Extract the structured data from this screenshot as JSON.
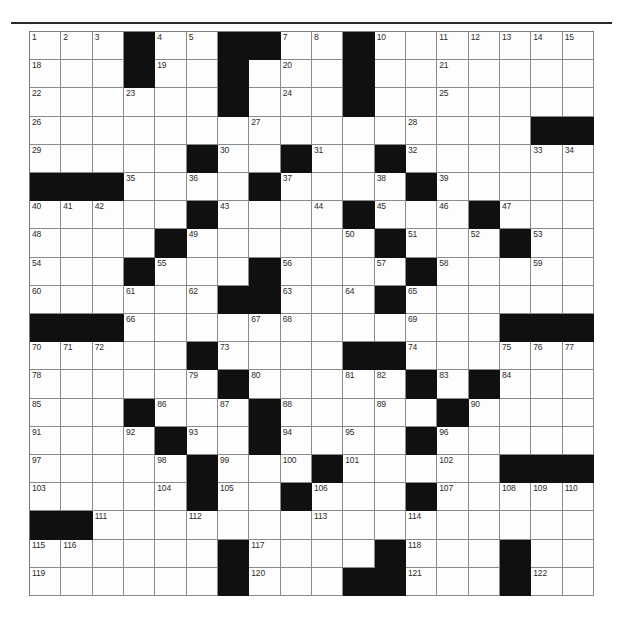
{
  "document": {
    "type": "crossword-puzzle-grid",
    "title": "",
    "has_top_rule": true
  },
  "grid": {
    "columns": 18,
    "rows": 20,
    "cell_background": "#fdfdfd",
    "block_color": "#101010",
    "line_color": "#8a8a8a",
    "number_color": "#2c2c2c",
    "blocks": [
      [
        0,
        3
      ],
      [
        0,
        6
      ],
      [
        0,
        7
      ],
      [
        0,
        10
      ],
      [
        1,
        3
      ],
      [
        1,
        6
      ],
      [
        1,
        10
      ],
      [
        2,
        6
      ],
      [
        2,
        10
      ],
      [
        3,
        16
      ],
      [
        3,
        17
      ],
      [
        4,
        5
      ],
      [
        4,
        8
      ],
      [
        4,
        11
      ],
      [
        5,
        0
      ],
      [
        5,
        1
      ],
      [
        5,
        2
      ],
      [
        5,
        7
      ],
      [
        5,
        12
      ],
      [
        6,
        5
      ],
      [
        6,
        10
      ],
      [
        6,
        14
      ],
      [
        7,
        4
      ],
      [
        7,
        11
      ],
      [
        7,
        15
      ],
      [
        8,
        3
      ],
      [
        8,
        7
      ],
      [
        8,
        12
      ],
      [
        9,
        6
      ],
      [
        9,
        7
      ],
      [
        9,
        11
      ],
      [
        10,
        0
      ],
      [
        10,
        1
      ],
      [
        10,
        2
      ],
      [
        10,
        15
      ],
      [
        10,
        16
      ],
      [
        10,
        17
      ],
      [
        11,
        5
      ],
      [
        11,
        10
      ],
      [
        11,
        11
      ],
      [
        12,
        6
      ],
      [
        12,
        12
      ],
      [
        12,
        14
      ],
      [
        13,
        3
      ],
      [
        13,
        7
      ],
      [
        13,
        13
      ],
      [
        14,
        4
      ],
      [
        14,
        7
      ],
      [
        14,
        12
      ],
      [
        15,
        5
      ],
      [
        15,
        9
      ],
      [
        15,
        15
      ],
      [
        15,
        16
      ],
      [
        15,
        17
      ],
      [
        16,
        5
      ],
      [
        16,
        8
      ],
      [
        16,
        12
      ],
      [
        17,
        0
      ],
      [
        17,
        1
      ],
      [
        18,
        6
      ],
      [
        18,
        11
      ],
      [
        19,
        6
      ],
      [
        19,
        11
      ],
      [
        20,
        6
      ],
      [
        20,
        11
      ],
      [
        18,
        15
      ],
      [
        19,
        15
      ],
      [
        19,
        10
      ],
      [
        20,
        10
      ],
      [
        20,
        15
      ]
    ],
    "numbers": [
      {
        "row": 0,
        "col": 0,
        "n": "1"
      },
      {
        "row": 0,
        "col": 1,
        "n": "2"
      },
      {
        "row": 0,
        "col": 2,
        "n": "3"
      },
      {
        "row": 0,
        "col": 4,
        "n": "4"
      },
      {
        "row": 0,
        "col": 5,
        "n": "5"
      },
      {
        "row": 0,
        "col": 6,
        "n": "6"
      },
      {
        "row": 0,
        "col": 8,
        "n": "7"
      },
      {
        "row": 0,
        "col": 9,
        "n": "8"
      },
      {
        "row": 0,
        "col": 10,
        "n": "9"
      },
      {
        "row": 0,
        "col": 11,
        "n": "10"
      },
      {
        "row": 0,
        "col": 13,
        "n": "11"
      },
      {
        "row": 0,
        "col": 14,
        "n": "12"
      },
      {
        "row": 0,
        "col": 15,
        "n": "13"
      },
      {
        "row": 0,
        "col": 16,
        "n": "14"
      },
      {
        "row": 0,
        "col": 17,
        "n": "15"
      },
      {
        "row": 0,
        "col": 18,
        "n": "16"
      },
      {
        "row": 0,
        "col": 19,
        "n": "17"
      },
      {
        "row": 1,
        "col": 0,
        "n": "18"
      },
      {
        "row": 1,
        "col": 4,
        "n": "19"
      },
      {
        "row": 1,
        "col": 8,
        "n": "20"
      },
      {
        "row": 1,
        "col": 13,
        "n": "21"
      },
      {
        "row": 2,
        "col": 0,
        "n": "22"
      },
      {
        "row": 2,
        "col": 3,
        "n": "23"
      },
      {
        "row": 2,
        "col": 8,
        "n": "24"
      },
      {
        "row": 2,
        "col": 13,
        "n": "25"
      },
      {
        "row": 3,
        "col": 0,
        "n": "26"
      },
      {
        "row": 3,
        "col": 7,
        "n": "27"
      },
      {
        "row": 3,
        "col": 12,
        "n": "28"
      },
      {
        "row": 4,
        "col": 0,
        "n": "29"
      },
      {
        "row": 4,
        "col": 6,
        "n": "30"
      },
      {
        "row": 4,
        "col": 9,
        "n": "31"
      },
      {
        "row": 4,
        "col": 12,
        "n": "32"
      },
      {
        "row": 4,
        "col": 16,
        "n": "33"
      },
      {
        "row": 4,
        "col": 17,
        "n": "34"
      },
      {
        "row": 5,
        "col": 3,
        "n": "35"
      },
      {
        "row": 5,
        "col": 5,
        "n": "36"
      },
      {
        "row": 5,
        "col": 8,
        "n": "37"
      },
      {
        "row": 5,
        "col": 11,
        "n": "38"
      },
      {
        "row": 5,
        "col": 13,
        "n": "39"
      },
      {
        "row": 6,
        "col": 0,
        "n": "40"
      },
      {
        "row": 6,
        "col": 1,
        "n": "41"
      },
      {
        "row": 6,
        "col": 2,
        "n": "42"
      },
      {
        "row": 6,
        "col": 6,
        "n": "43"
      },
      {
        "row": 6,
        "col": 9,
        "n": "44"
      },
      {
        "row": 6,
        "col": 11,
        "n": "45"
      },
      {
        "row": 6,
        "col": 13,
        "n": "46"
      },
      {
        "row": 6,
        "col": 15,
        "n": "47"
      },
      {
        "row": 7,
        "col": 0,
        "n": "48"
      },
      {
        "row": 7,
        "col": 5,
        "n": "49"
      },
      {
        "row": 7,
        "col": 10,
        "n": "50"
      },
      {
        "row": 7,
        "col": 12,
        "n": "51"
      },
      {
        "row": 7,
        "col": 14,
        "n": "52"
      },
      {
        "row": 7,
        "col": 16,
        "n": "53"
      },
      {
        "row": 8,
        "col": 0,
        "n": "54"
      },
      {
        "row": 8,
        "col": 4,
        "n": "55"
      },
      {
        "row": 8,
        "col": 8,
        "n": "56"
      },
      {
        "row": 8,
        "col": 11,
        "n": "57"
      },
      {
        "row": 8,
        "col": 13,
        "n": "58"
      },
      {
        "row": 8,
        "col": 16,
        "n": "59"
      },
      {
        "row": 9,
        "col": 0,
        "n": "60"
      },
      {
        "row": 9,
        "col": 3,
        "n": "61"
      },
      {
        "row": 9,
        "col": 5,
        "n": "62"
      },
      {
        "row": 9,
        "col": 8,
        "n": "63"
      },
      {
        "row": 9,
        "col": 10,
        "n": "64"
      },
      {
        "row": 9,
        "col": 12,
        "n": "65"
      },
      {
        "row": 10,
        "col": 3,
        "n": "66"
      },
      {
        "row": 10,
        "col": 7,
        "n": "67"
      },
      {
        "row": 10,
        "col": 8,
        "n": "68"
      },
      {
        "row": 10,
        "col": 12,
        "n": "69"
      },
      {
        "row": 11,
        "col": 0,
        "n": "70"
      },
      {
        "row": 11,
        "col": 1,
        "n": "71"
      },
      {
        "row": 11,
        "col": 2,
        "n": "72"
      },
      {
        "row": 11,
        "col": 6,
        "n": "73"
      },
      {
        "row": 11,
        "col": 12,
        "n": "74"
      },
      {
        "row": 11,
        "col": 15,
        "n": "75"
      },
      {
        "row": 11,
        "col": 16,
        "n": "76"
      },
      {
        "row": 11,
        "col": 17,
        "n": "77"
      },
      {
        "row": 12,
        "col": 0,
        "n": "78"
      },
      {
        "row": 12,
        "col": 5,
        "n": "79"
      },
      {
        "row": 12,
        "col": 7,
        "n": "80"
      },
      {
        "row": 12,
        "col": 10,
        "n": "81"
      },
      {
        "row": 12,
        "col": 11,
        "n": "82"
      },
      {
        "row": 12,
        "col": 13,
        "n": "83"
      },
      {
        "row": 12,
        "col": 15,
        "n": "84"
      },
      {
        "row": 13,
        "col": 0,
        "n": "85"
      },
      {
        "row": 13,
        "col": 4,
        "n": "86"
      },
      {
        "row": 13,
        "col": 6,
        "n": "87"
      },
      {
        "row": 13,
        "col": 8,
        "n": "88"
      },
      {
        "row": 13,
        "col": 11,
        "n": "89"
      },
      {
        "row": 13,
        "col": 14,
        "n": "90"
      },
      {
        "row": 14,
        "col": 0,
        "n": "91"
      },
      {
        "row": 14,
        "col": 3,
        "n": "92"
      },
      {
        "row": 14,
        "col": 5,
        "n": "93"
      },
      {
        "row": 14,
        "col": 8,
        "n": "94"
      },
      {
        "row": 14,
        "col": 10,
        "n": "95"
      },
      {
        "row": 14,
        "col": 13,
        "n": "96"
      },
      {
        "row": 15,
        "col": 0,
        "n": "97"
      },
      {
        "row": 15,
        "col": 4,
        "n": "98"
      },
      {
        "row": 15,
        "col": 6,
        "n": "99"
      },
      {
        "row": 15,
        "col": 8,
        "n": "100"
      },
      {
        "row": 15,
        "col": 10,
        "n": "101"
      },
      {
        "row": 15,
        "col": 13,
        "n": "102"
      },
      {
        "row": 16,
        "col": 0,
        "n": "103"
      },
      {
        "row": 16,
        "col": 4,
        "n": "104"
      },
      {
        "row": 16,
        "col": 6,
        "n": "105"
      },
      {
        "row": 16,
        "col": 9,
        "n": "106"
      },
      {
        "row": 16,
        "col": 13,
        "n": "107"
      },
      {
        "row": 16,
        "col": 15,
        "n": "108"
      },
      {
        "row": 16,
        "col": 16,
        "n": "109"
      },
      {
        "row": 16,
        "col": 17,
        "n": "110"
      },
      {
        "row": 17,
        "col": 2,
        "n": "111"
      },
      {
        "row": 17,
        "col": 5,
        "n": "112"
      },
      {
        "row": 17,
        "col": 9,
        "n": "113"
      },
      {
        "row": 17,
        "col": 12,
        "n": "114"
      },
      {
        "row": 18,
        "col": 0,
        "n": "115"
      },
      {
        "row": 18,
        "col": 1,
        "n": "116"
      },
      {
        "row": 18,
        "col": 7,
        "n": "117"
      },
      {
        "row": 18,
        "col": 12,
        "n": "118"
      },
      {
        "row": 19,
        "col": 0,
        "n": "119"
      },
      {
        "row": 19,
        "col": 7,
        "n": "120"
      },
      {
        "row": 19,
        "col": 12,
        "n": "121"
      },
      {
        "row": 19,
        "col": 16,
        "n": "122"
      },
      {
        "row": 20,
        "col": 0,
        "n": "123"
      },
      {
        "row": 20,
        "col": 7,
        "n": "124"
      },
      {
        "row": 20,
        "col": 12,
        "n": "125"
      },
      {
        "row": 20,
        "col": 16,
        "n": "126"
      }
    ]
  }
}
